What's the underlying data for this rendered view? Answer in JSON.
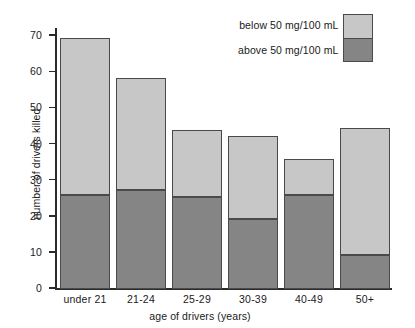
{
  "chart_data": {
    "type": "bar",
    "subtype": "stacked",
    "title": "",
    "xlabel": "age of drivers (years)",
    "ylabel": "number of drivers killed",
    "categories": [
      "under 21",
      "21-24",
      "25-29",
      "30-39",
      "40-49",
      "50+"
    ],
    "series": [
      {
        "name": "above 50 mg/100 mL",
        "color": "#858585",
        "values": [
          26,
          27.5,
          25.5,
          19.5,
          26,
          9.5
        ]
      },
      {
        "name": "below 50 mg/100 mL",
        "color": "#c7c7c7",
        "values": [
          43.5,
          31,
          18.5,
          23,
          10,
          35
        ]
      }
    ],
    "totals": [
      69.5,
      58.5,
      44,
      42.5,
      36,
      44.5
    ],
    "ylim": [
      0,
      72
    ],
    "yticks": [
      0,
      10,
      20,
      30,
      40,
      50,
      60,
      70
    ],
    "ytick_labels": [
      "0",
      "10",
      "20",
      "30",
      "40",
      "50",
      "60",
      "70"
    ],
    "grid": false,
    "legend_position": "top-right"
  },
  "legend": {
    "entries": [
      {
        "label": "below 50 mg/100 mL",
        "swatch": "#c7c7c7"
      },
      {
        "label": "above 50 mg/100 mL",
        "swatch": "#858585"
      }
    ]
  },
  "axes": {
    "y_title": "number of drivers killed",
    "x_title": "age of drivers (years)"
  }
}
